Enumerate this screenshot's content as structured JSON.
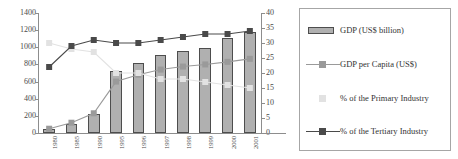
{
  "chart_data": {
    "type": "bar",
    "title": "",
    "subtitle": "",
    "xlabel": "",
    "ylabel": "",
    "y2label": "",
    "grid": false,
    "legend_position": "right",
    "categories": [
      "1980",
      "1985",
      "1990",
      "1995",
      "1996",
      "1997",
      "1998",
      "1999",
      "2000",
      "2001"
    ],
    "axes": {
      "left": {
        "min": 0,
        "max": 1400,
        "step": 200,
        "ticks": [
          "0",
          "200",
          "400",
          "600",
          "800",
          "1000",
          "1200",
          "1400"
        ]
      },
      "right": {
        "min": 0,
        "max": 40,
        "step": 5,
        "ticks": [
          "0",
          "5",
          "10",
          "15",
          "20",
          "25",
          "30",
          "35",
          "40"
        ]
      }
    },
    "series": [
      {
        "name": "GDP (US$ billion)",
        "type": "bar",
        "axis": "left",
        "color": "#b0b0b0",
        "edge_color": "#4d4d4d",
        "values": [
          45,
          110,
          225,
          725,
          820,
          910,
          960,
          990,
          1110,
          1175
        ]
      },
      {
        "name": "GDP per Capita (US$)",
        "type": "line",
        "axis": "left",
        "color": "#9a9a9a",
        "marker": "square",
        "values": [
          50,
          120,
          230,
          600,
          680,
          740,
          775,
          800,
          830,
          865
        ]
      },
      {
        "name": "% of the Primary Industry",
        "type": "line",
        "axis": "right",
        "color": "#e2e2e2",
        "marker": "square",
        "values": [
          30,
          28,
          27,
          20,
          20,
          18,
          18,
          17,
          16,
          15
        ]
      },
      {
        "name": "% of the Tertiary Industry",
        "type": "line",
        "axis": "right",
        "color": "#4a4a4a",
        "marker": "square",
        "values": [
          22,
          29,
          31,
          30,
          30,
          31,
          32,
          33,
          33,
          34
        ]
      }
    ]
  },
  "legend": {
    "items": [
      {
        "label": "GDP (US$ billion)",
        "key": "swatch",
        "color": "#b0b0b0"
      },
      {
        "label": "GDP per Capita (US$)",
        "key": "line-marker",
        "color": "#9a9a9a"
      },
      {
        "label": "% of the Primary Industry",
        "key": "marker",
        "color": "#e2e2e2"
      },
      {
        "label": "% of the Tertiary Industry",
        "key": "line-marker",
        "color": "#4a4a4a"
      }
    ]
  }
}
